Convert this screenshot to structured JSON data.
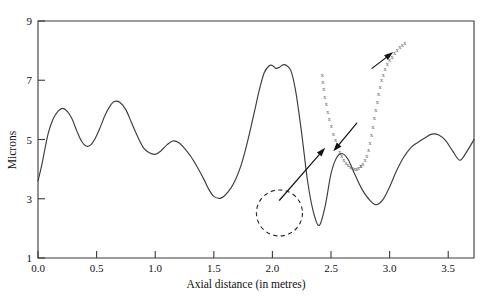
{
  "chart_data": {
    "type": "line",
    "title": "",
    "xlabel": "Axial distance (in metres)",
    "ylabel": "Microns",
    "xlim": [
      0.0,
      3.72
    ],
    "ylim": [
      1,
      9
    ],
    "grid": false,
    "legend": "none",
    "xticks": [
      "0.0",
      "0.5",
      "1.0",
      "1.5",
      "2.0",
      "2.5",
      "3.0",
      "3.5"
    ],
    "xtick_values": [
      0.0,
      0.5,
      1.0,
      1.5,
      2.0,
      2.5,
      3.0,
      3.5
    ],
    "yticks": [
      "1",
      "3",
      "5",
      "7",
      "9"
    ],
    "ytick_values": [
      1,
      3,
      5,
      7,
      9
    ],
    "series": [
      {
        "name": "surface-roughness-profile",
        "marker": "none",
        "style": "solid",
        "x": [
          0.0,
          0.03,
          0.06,
          0.09,
          0.13,
          0.17,
          0.21,
          0.25,
          0.29,
          0.33,
          0.37,
          0.41,
          0.45,
          0.49,
          0.53,
          0.57,
          0.61,
          0.65,
          0.7,
          0.75,
          0.8,
          0.85,
          0.9,
          0.95,
          1.0,
          1.05,
          1.1,
          1.15,
          1.2,
          1.25,
          1.3,
          1.34,
          1.38,
          1.42,
          1.46,
          1.5,
          1.56,
          1.62,
          1.68,
          1.73,
          1.77,
          1.81,
          1.85,
          1.89,
          1.93,
          1.97,
          2.0,
          2.03,
          2.06,
          2.09,
          2.12,
          2.16,
          2.2,
          2.25,
          2.3,
          2.35,
          2.4,
          2.45,
          2.5,
          2.55,
          2.6,
          2.65,
          2.7,
          2.76,
          2.82,
          2.88,
          2.94,
          3.0,
          3.06,
          3.12,
          3.18,
          3.24,
          3.3,
          3.36,
          3.42,
          3.48,
          3.54,
          3.6,
          3.66,
          3.72
        ],
        "y": [
          3.6,
          4.1,
          4.7,
          5.25,
          5.7,
          5.95,
          6.05,
          5.95,
          5.7,
          5.3,
          4.95,
          4.78,
          4.82,
          5.05,
          5.4,
          5.8,
          6.1,
          6.28,
          6.25,
          6.0,
          5.55,
          5.1,
          4.72,
          4.55,
          4.5,
          4.62,
          4.82,
          4.95,
          4.9,
          4.7,
          4.45,
          4.2,
          3.92,
          3.62,
          3.3,
          3.08,
          3.02,
          3.22,
          3.6,
          4.1,
          4.65,
          5.3,
          6.0,
          6.7,
          7.25,
          7.48,
          7.5,
          7.4,
          7.44,
          7.52,
          7.5,
          7.3,
          6.6,
          5.2,
          3.6,
          2.55,
          2.1,
          2.75,
          3.85,
          4.4,
          4.52,
          4.3,
          3.85,
          3.35,
          3.0,
          2.8,
          2.95,
          3.4,
          3.95,
          4.4,
          4.72,
          4.9,
          5.05,
          5.18,
          5.15,
          4.95,
          4.6,
          4.3,
          4.6,
          5.0
        ]
      },
      {
        "name": "magnified-defect-left-branch",
        "marker": "x",
        "style": "dotted",
        "x": [
          2.425,
          2.43,
          2.438,
          2.448,
          2.46,
          2.472,
          2.486,
          2.502,
          2.52,
          2.538,
          2.556,
          2.574,
          2.592,
          2.61,
          2.628,
          2.646,
          2.664,
          2.682,
          2.7,
          2.718,
          2.736,
          2.754
        ],
        "y": [
          7.2,
          6.95,
          6.7,
          6.45,
          6.2,
          5.95,
          5.7,
          5.45,
          5.2,
          4.98,
          4.78,
          4.6,
          4.45,
          4.32,
          4.22,
          4.14,
          4.08,
          4.04,
          4.02,
          4.02,
          4.05,
          4.1
        ]
      },
      {
        "name": "magnified-defect-right-branch",
        "marker": "x",
        "style": "dotted",
        "x": [
          2.754,
          2.772,
          2.79,
          2.806,
          2.82,
          2.834,
          2.846,
          2.858,
          2.87,
          2.882,
          2.894,
          2.906,
          2.918,
          2.932,
          2.946,
          2.962,
          2.98,
          3.0,
          3.02,
          3.042,
          3.064,
          3.086,
          3.108,
          3.13
        ],
        "y": [
          4.1,
          4.18,
          4.3,
          4.46,
          4.66,
          4.9,
          5.16,
          5.44,
          5.72,
          6.0,
          6.28,
          6.54,
          6.78,
          7.0,
          7.2,
          7.38,
          7.54,
          7.68,
          7.8,
          7.92,
          8.02,
          8.12,
          8.2,
          8.28
        ]
      }
    ],
    "annotations": [
      {
        "name": "defect-highlight-circle",
        "type": "dashed-ellipse",
        "center_x": 2.06,
        "center_y": 2.52,
        "radius_px": 23
      },
      {
        "name": "magnification-callout-arrow",
        "type": "arrow",
        "from_x": 2.06,
        "from_y": 2.95,
        "to_x": 2.45,
        "to_y": 4.72
      },
      {
        "name": "defect-trough-pointer-arrow",
        "type": "arrow",
        "from_x": 2.72,
        "from_y": 5.55,
        "to_x": 2.52,
        "to_y": 4.6
      },
      {
        "name": "defect-slope-pointer-arrow",
        "type": "arrow",
        "from_x": 2.85,
        "from_y": 7.4,
        "to_x": 3.03,
        "to_y": 7.95
      }
    ]
  },
  "axes": {
    "y_label": "Microns",
    "x_label": "Axial distance (in metres)",
    "y_tick_labels": [
      "9",
      "7",
      "5",
      "3",
      "1"
    ],
    "x_tick_labels": [
      "0.0",
      "0.5",
      "1.0",
      "1.5",
      "2.0",
      "2.5",
      "3.0",
      "3.5"
    ]
  },
  "colors": {
    "curve": "#3c3c3c",
    "frame": "#3a3a3a",
    "marker": "#5e5e5e",
    "annotation": "#121212",
    "background": "#ffffff"
  }
}
